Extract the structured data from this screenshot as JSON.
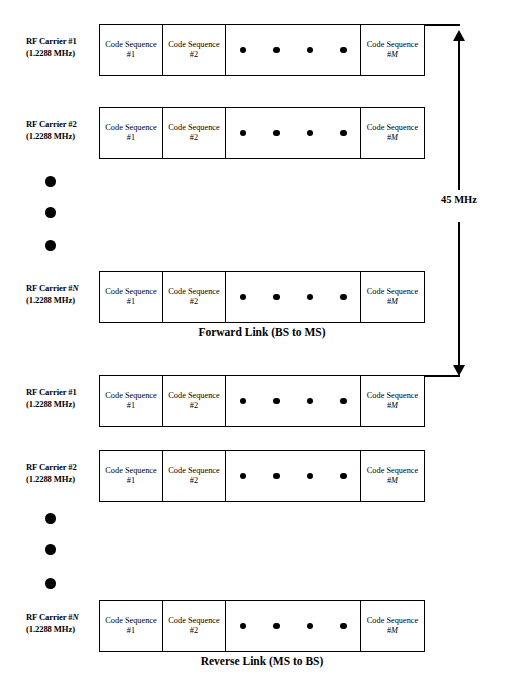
{
  "diagram": {
    "title_forward": "Forward Link (BS to MS)",
    "title_reverse": "Reverse Link (MS to BS)",
    "separation": {
      "label": "45 MHz",
      "arrow": "double-headed-vertical-arrow"
    },
    "cell_labels": {
      "sequence_1_line1": "Code Sequence",
      "sequence_1_line2": "#1",
      "sequence_2_line1": "Code Sequence",
      "sequence_2_line2": "#2",
      "sequence_m_line1": "Code Sequence",
      "sequence_m_line2_prefix": "#",
      "sequence_m_line2_italic": "M",
      "ellipsis_dot_count": 4
    },
    "vertical_ellipsis_dot_count": 3,
    "forward_rows": [
      {
        "carrier_line1": "RF Carrier #1",
        "carrier_line2": "(1.2288 MHz)",
        "carrier_index": "1",
        "carrier_index_italic": false
      },
      {
        "carrier_line1": "RF Carrier #2",
        "carrier_line2": "(1.2288 MHz)",
        "carrier_index": "2",
        "carrier_index_italic": false
      },
      {
        "carrier_line1_prefix": "RF Carrier #",
        "carrier_line1_italic": "N",
        "carrier_line2": "(1.2288 MHz)",
        "carrier_index": "N",
        "carrier_index_italic": true
      }
    ],
    "reverse_rows": [
      {
        "carrier_line1": "RF Carrier #1",
        "carrier_line2": "(1.2288 MHz)",
        "carrier_index": "1",
        "carrier_index_italic": false
      },
      {
        "carrier_line1": "RF Carrier #2",
        "carrier_line2": "(1.2288 MHz)",
        "carrier_index": "2",
        "carrier_index_italic": false
      },
      {
        "carrier_line1_prefix": "RF Carrier #",
        "carrier_line1_italic": "N",
        "carrier_line2": "(1.2288 MHz)",
        "carrier_index": "N",
        "carrier_index_italic": true
      }
    ],
    "colors": {
      "stroke": "#000000",
      "background": "#ffffff"
    }
  }
}
